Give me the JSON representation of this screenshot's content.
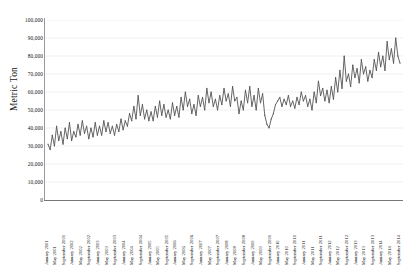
{
  "chart_data": {
    "type": "line",
    "title": "",
    "xlabel": "",
    "ylabel": "Metric Ton",
    "ylim": [
      0,
      100000
    ],
    "ytick_labels": [
      "100,000",
      "90,000",
      "80,000",
      "70,000",
      "60,000",
      "50,000",
      "40,000",
      "30,000",
      "20,000",
      "10,000",
      "0"
    ],
    "ytick_values": [
      100000,
      90000,
      80000,
      70000,
      60000,
      50000,
      40000,
      30000,
      20000,
      10000,
      0
    ],
    "grid": true,
    "legend": null,
    "line_color": "#555555",
    "x_tick_label_interval_months": 4,
    "x_tick_labels": [
      "January 2001",
      "May 2001",
      "September 2001",
      "January 2002",
      "May 2002",
      "September 2002",
      "January 2003",
      "May 2003",
      "September 2003",
      "January 2004",
      "May 2004",
      "September 2004",
      "January 2005",
      "May 2005",
      "September 2005",
      "January 2006",
      "May 2006",
      "September 2006",
      "January 2007",
      "May 2007",
      "September 2007",
      "January 2008",
      "May 2008",
      "September 2008",
      "January 2009",
      "May 2009",
      "September 2009",
      "January 2010",
      "May 2010",
      "September 2010",
      "January 2011",
      "May 2011",
      "September 2011",
      "January 2012",
      "May 2012",
      "September 2012",
      "January 2013",
      "May 2013",
      "September 2013",
      "January 2014",
      "May 2014",
      "September 2014"
    ],
    "x_start": "January 2001",
    "x_end": "September 2014",
    "n_points": 165,
    "values": [
      31000,
      28000,
      36000,
      30000,
      41000,
      33000,
      38000,
      31000,
      40000,
      34000,
      43000,
      33000,
      38000,
      35000,
      42000,
      36000,
      44000,
      37000,
      41000,
      34000,
      40000,
      35000,
      43000,
      36000,
      41000,
      36000,
      44000,
      38000,
      43000,
      37000,
      41000,
      36000,
      42000,
      38000,
      45000,
      39000,
      44000,
      41000,
      48000,
      44000,
      52000,
      45000,
      58000,
      47000,
      53000,
      45000,
      50000,
      44000,
      49000,
      44000,
      52000,
      46000,
      55000,
      47000,
      53000,
      46000,
      50000,
      45000,
      54000,
      47000,
      52000,
      46000,
      57000,
      50000,
      60000,
      52000,
      56000,
      48000,
      53000,
      47000,
      58000,
      52000,
      57000,
      50000,
      62000,
      54000,
      60000,
      52000,
      56000,
      50000,
      58000,
      53000,
      62000,
      55000,
      59000,
      52000,
      63000,
      55000,
      57000,
      48000,
      55000,
      50000,
      61000,
      54000,
      63000,
      52000,
      58000,
      50000,
      62000,
      54000,
      59000,
      47000,
      42000,
      40000,
      45000,
      48000,
      53000,
      55000,
      57000,
      52000,
      56000,
      53000,
      58000,
      52000,
      55000,
      51000,
      57000,
      53000,
      60000,
      55000,
      58000,
      52000,
      56000,
      50000,
      60000,
      54000,
      66000,
      58000,
      62000,
      55000,
      61000,
      54000,
      63000,
      56000,
      68000,
      60000,
      72000,
      62000,
      80000,
      66000,
      70000,
      63000,
      75000,
      68000,
      73000,
      65000,
      78000,
      70000,
      74000,
      66000,
      72000,
      68000,
      78000,
      72000,
      82000,
      74000,
      80000,
      72000,
      88000,
      78000,
      84000,
      76000,
      90000,
      80000,
      76000
    ]
  }
}
